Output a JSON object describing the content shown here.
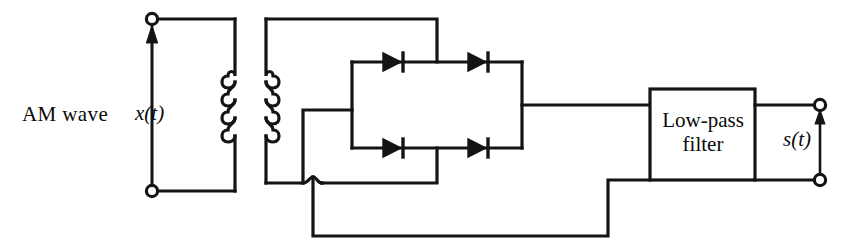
{
  "diagram": {
    "type": "circuit-schematic",
    "stroke_color": "#141414",
    "background_color": "#ffffff",
    "labels": {
      "input_name": "AM wave",
      "input_signal": "x(t)",
      "output_signal": "s(t)",
      "filter_line1": "Low-pass",
      "filter_line2": "filter"
    },
    "blocks": [
      {
        "name": "low-pass-filter",
        "text_line1": "Low-pass",
        "text_line2": "filter"
      }
    ],
    "components": [
      {
        "name": "transformer-primary-coil",
        "turns": 4
      },
      {
        "name": "transformer-secondary-coil",
        "turns": 4
      },
      {
        "name": "diode-top-left",
        "direction": "right"
      },
      {
        "name": "diode-top-right",
        "direction": "right"
      },
      {
        "name": "diode-bottom-left",
        "direction": "right"
      },
      {
        "name": "diode-bottom-right",
        "direction": "right"
      }
    ],
    "terminals": [
      {
        "name": "input-terminal-top"
      },
      {
        "name": "input-terminal-bottom"
      },
      {
        "name": "output-terminal-top"
      },
      {
        "name": "output-terminal-bottom"
      }
    ],
    "arrows": [
      {
        "name": "input-voltage-arrow",
        "direction": "up"
      },
      {
        "name": "output-voltage-arrow",
        "direction": "up"
      }
    ]
  }
}
